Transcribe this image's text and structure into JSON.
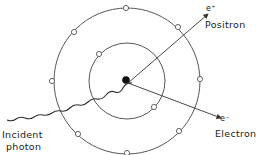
{
  "diagram": {
    "labels": {
      "positron_symbol": "e⁺",
      "positron": "Positron",
      "electron_symbol": "e⁻",
      "electron": "Electron",
      "photon_line1": "Incident",
      "photon_line2": "photon"
    },
    "colors": {
      "stroke": "#333333",
      "nucleus": "#111111",
      "background": "#ffffff"
    }
  }
}
